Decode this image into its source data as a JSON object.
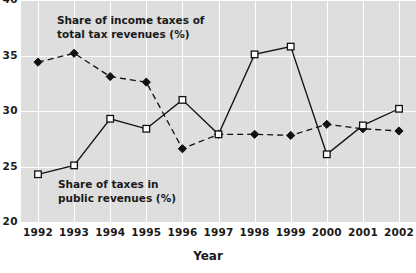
{
  "chart_data": {
    "type": "line",
    "title": "",
    "xlabel": "Year",
    "ylabel": "",
    "categories": [
      "1992",
      "1993",
      "1994",
      "1995",
      "1996",
      "1997",
      "1998",
      "1999",
      "2000",
      "2001",
      "2002"
    ],
    "x": [
      1992,
      1993,
      1994,
      1995,
      1996,
      1997,
      1998,
      1999,
      2000,
      2001,
      2002
    ],
    "ylim": [
      20,
      40
    ],
    "xlim": [
      1992,
      2002
    ],
    "yticks": [
      20,
      25,
      30,
      35,
      40
    ],
    "ytick_labels": [
      "20",
      "25",
      "30",
      "35",
      "40"
    ],
    "grid": true,
    "legend_position": "in-plot annotations",
    "series": [
      {
        "name": "Share of income taxes of total tax revenues (%)",
        "marker": "filled-diamond",
        "linestyle": "dashed",
        "color": "#111111",
        "values": [
          34.4,
          35.2,
          33.1,
          32.6,
          26.6,
          27.9,
          27.9,
          27.8,
          28.8,
          28.4,
          28.2
        ]
      },
      {
        "name": "Share of taxes in public revenues (%)",
        "marker": "open-square",
        "linestyle": "solid",
        "color": "#111111",
        "values": [
          24.3,
          25.1,
          29.3,
          28.4,
          31.0,
          27.9,
          35.1,
          35.8,
          26.1,
          28.7,
          30.2
        ]
      }
    ],
    "annotations": [
      {
        "id": "income",
        "lines": [
          "Share of income taxes of",
          "total tax revenues (%)"
        ]
      },
      {
        "id": "public",
        "lines": [
          "Share of taxes in",
          "public revenues (%)"
        ]
      }
    ],
    "colors": {
      "plot_background": "#dedede",
      "gridline": "#ffffff",
      "line": "#111111",
      "page_background": "#ffffff",
      "text": "#1a1a1a"
    }
  }
}
